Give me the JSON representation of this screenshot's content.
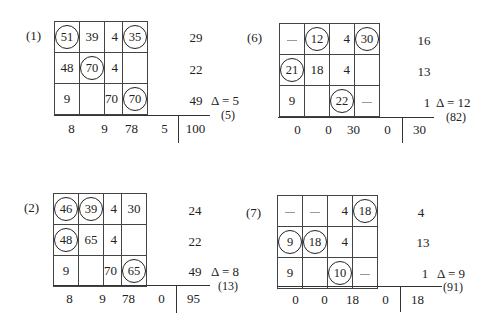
{
  "panels": [
    {
      "id": "1",
      "label": "(1)",
      "rows": [
        [
          {
            "v": "51",
            "c": true
          },
          {
            "v": "39",
            "c": false
          },
          {
            "v": "4",
            "c": false,
            "r": true
          },
          {
            "v": "35",
            "c": true
          }
        ],
        [
          {
            "v": "48",
            "c": false
          },
          {
            "v": "70",
            "c": true
          },
          {
            "v": "4",
            "c": false,
            "r": true
          },
          {
            "v": "",
            "c": false
          }
        ],
        [
          {
            "v": "9",
            "c": false
          },
          {
            "v": "",
            "c": false
          },
          {
            "v": "70",
            "c": false,
            "r": true
          },
          {
            "v": "70",
            "c": true
          }
        ]
      ],
      "row_sums": [
        "29",
        "22",
        "49"
      ],
      "col_sums": [
        "8",
        "9",
        "78",
        "5"
      ],
      "total": "100",
      "delta": "Δ = 5",
      "sub": "(5)"
    },
    {
      "id": "6",
      "label": "(6)",
      "rows": [
        [
          {
            "v": "—",
            "c": false,
            "d": true
          },
          {
            "v": "12",
            "c": true
          },
          {
            "v": "4",
            "c": false,
            "r": true
          },
          {
            "v": "30",
            "c": true
          }
        ],
        [
          {
            "v": "21",
            "c": true
          },
          {
            "v": "18",
            "c": false
          },
          {
            "v": "4",
            "c": false,
            "r": true
          },
          {
            "v": "",
            "c": false
          }
        ],
        [
          {
            "v": "9",
            "c": false
          },
          {
            "v": "",
            "c": false
          },
          {
            "v": "22",
            "c": true
          },
          {
            "v": "—",
            "c": false,
            "d": true
          }
        ]
      ],
      "row_sums": [
        "16",
        "13",
        "1"
      ],
      "col_sums": [
        "0",
        "0",
        "30",
        "0"
      ],
      "total": "30",
      "delta": "Δ = 12",
      "sub": "(82)"
    },
    {
      "id": "2",
      "label": "(2)",
      "rows": [
        [
          {
            "v": "46",
            "c": true
          },
          {
            "v": "39",
            "c": true
          },
          {
            "v": "4",
            "c": false,
            "r": true
          },
          {
            "v": "30",
            "c": false
          }
        ],
        [
          {
            "v": "48",
            "c": true
          },
          {
            "v": "65",
            "c": false
          },
          {
            "v": "4",
            "c": false,
            "r": true
          },
          {
            "v": "",
            "c": false
          }
        ],
        [
          {
            "v": "9",
            "c": false
          },
          {
            "v": "",
            "c": false
          },
          {
            "v": "70",
            "c": false,
            "r": true
          },
          {
            "v": "65",
            "c": true
          }
        ]
      ],
      "row_sums": [
        "24",
        "22",
        "49"
      ],
      "col_sums": [
        "8",
        "9",
        "78",
        "0"
      ],
      "total": "95",
      "delta": "Δ = 8",
      "sub": "(13)"
    },
    {
      "id": "7",
      "label": "(7)",
      "rows": [
        [
          {
            "v": "—",
            "c": false,
            "d": true
          },
          {
            "v": "—",
            "c": false,
            "d": true
          },
          {
            "v": "4",
            "c": false,
            "r": true
          },
          {
            "v": "18",
            "c": true
          }
        ],
        [
          {
            "v": "9",
            "c": true
          },
          {
            "v": "18",
            "c": true
          },
          {
            "v": "4",
            "c": false,
            "r": true
          },
          {
            "v": "",
            "c": false
          }
        ],
        [
          {
            "v": "9",
            "c": false
          },
          {
            "v": "",
            "c": false
          },
          {
            "v": "10",
            "c": true
          },
          {
            "v": "—",
            "c": false,
            "d": true
          }
        ]
      ],
      "row_sums": [
        "4",
        "13",
        "1"
      ],
      "col_sums": [
        "0",
        "0",
        "18",
        "0"
      ],
      "total": "18",
      "delta": "Δ = 9",
      "sub": "(91)"
    }
  ]
}
